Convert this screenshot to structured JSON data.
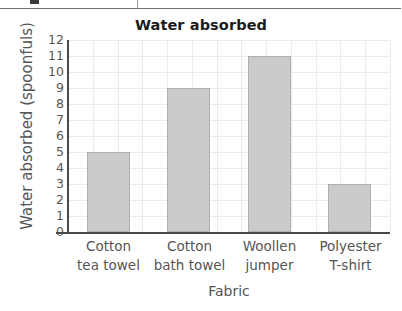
{
  "top_strip": {
    "icon": "small-dark-icon-fragment"
  },
  "chart_data": {
    "type": "bar",
    "title": "Water absorbed",
    "xlabel": "Fabric",
    "ylabel": "Water absorbed (spoonfuls)",
    "categories": [
      "Cotton tea towel",
      "Cotton bath towel",
      "Woollen jumper",
      "Polyester T-shirt"
    ],
    "category_lines": [
      [
        "Cotton",
        "tea towel"
      ],
      [
        "Cotton",
        "bath towel"
      ],
      [
        "Woollen",
        "jumper"
      ],
      [
        "Polyester",
        "T-shirt"
      ]
    ],
    "values": [
      5,
      9,
      11,
      3
    ],
    "ylim": [
      0,
      12
    ],
    "ytick_labels": [
      "12",
      "11",
      "10",
      "9",
      "8",
      "7",
      "6",
      "5",
      "4",
      "3",
      "2",
      "1",
      "0"
    ],
    "ytick_values": [
      12,
      11,
      10,
      9,
      8,
      7,
      6,
      5,
      4,
      3,
      2,
      1,
      0
    ],
    "grid": true,
    "legend": "none",
    "bar_color": "#cbcbcb",
    "bar_border_color": "#aeaeae",
    "axis_color": "#4a4a4a",
    "grid_color": "#eceaea",
    "text_color": "#555555",
    "title_color": "#1b1b1b"
  }
}
